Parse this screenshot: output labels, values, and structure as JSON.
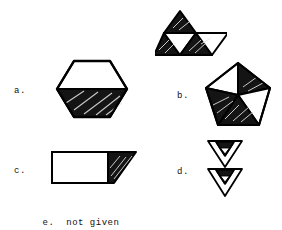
{
  "page": {
    "background_color": "#ffffff",
    "ink_color": "#000000"
  },
  "options": [
    {
      "key": "a",
      "label": "a.",
      "figure_name": "hexagon-half-shaded",
      "shape": "hexagon",
      "shaded_parts": [
        "bottom-half"
      ],
      "unshaded_parts": [
        "top-half"
      ],
      "fill": "#111111",
      "stroke": "#000000"
    },
    {
      "key": "b",
      "label": "b.",
      "figure_name": "triangle-strip-and-pentagon",
      "shapes": [
        "triangle-strip",
        "pentagon"
      ],
      "triangle_strip": {
        "triangles": [
          {
            "name": "upper-left-up",
            "shaded": true
          },
          {
            "name": "lower-left-up",
            "shaded": true
          },
          {
            "name": "center-down",
            "shaded": false
          },
          {
            "name": "right-up",
            "shaded": true
          },
          {
            "name": "right-down",
            "shaded": false
          }
        ]
      },
      "pentagon": {
        "sectors": [
          {
            "name": "top-left",
            "shaded": false
          },
          {
            "name": "top-right",
            "shaded": true
          },
          {
            "name": "right",
            "shaded": false
          },
          {
            "name": "bottom",
            "shaded": true
          },
          {
            "name": "left",
            "shaded": true
          }
        ]
      },
      "fill": "#111111",
      "stroke": "#000000"
    },
    {
      "key": "c",
      "label": "c.",
      "figure_name": "rectangle-with-shaded-right-triangle",
      "shape": "rectangle-plus-triangle",
      "shaded_parts": [
        "right-triangle-wedge"
      ],
      "unshaded_parts": [
        "rectangle"
      ],
      "fill": "#111111",
      "stroke": "#000000"
    },
    {
      "key": "d",
      "label": "d.",
      "figure_name": "two-stacked-inverted-triangles",
      "shape": "inverted-triangles",
      "count": 2,
      "each_triangle": {
        "outer": "unshaded",
        "inner_upper_band": "shaded",
        "inner_small_triangle": "unshaded"
      },
      "fill": "#111111",
      "stroke": "#000000"
    },
    {
      "key": "e",
      "label": "e.",
      "text": "not given",
      "figure_name": "none"
    }
  ]
}
